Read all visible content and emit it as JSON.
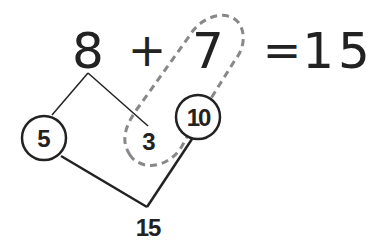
{
  "equation": {
    "addend1": "8",
    "operator": "+",
    "addend2": "7",
    "equals": "=",
    "sum": "15"
  },
  "decomposition": {
    "part_a": "5",
    "part_b": "3",
    "make_ten": "10",
    "result": "15"
  },
  "colors": {
    "ink": "#222222",
    "dashed": "#888888",
    "background": "#ffffff"
  }
}
